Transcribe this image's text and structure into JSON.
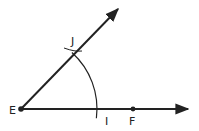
{
  "diagram": {
    "colors": {
      "stroke": "#222222",
      "background": "#ffffff"
    },
    "points": [
      {
        "id": "E",
        "label": "E",
        "x": 21,
        "y": 109,
        "dot": true,
        "label_x": 9,
        "label_y": 114
      },
      {
        "id": "J",
        "label": "J",
        "x": 74,
        "y": 55,
        "dot": false,
        "label_x": 71,
        "label_y": 45
      },
      {
        "id": "I",
        "label": "I",
        "x": 96,
        "y": 109,
        "dot": false,
        "label_x": 105,
        "label_y": 125
      },
      {
        "id": "F",
        "label": "F",
        "x": 133,
        "y": 109,
        "dot": true,
        "label_x": 129,
        "label_y": 125
      }
    ],
    "rays": [
      {
        "id": "ray-EF",
        "from": [
          21,
          109
        ],
        "to": [
          188,
          109
        ]
      },
      {
        "id": "ray-EJ",
        "from": [
          21,
          109
        ],
        "to": [
          118,
          9
        ]
      }
    ],
    "arcs": [
      {
        "id": "arc-centered-E",
        "center": [
          21,
          109
        ],
        "radius": 76,
        "start_deg": -48,
        "end_deg": 7
      }
    ],
    "tick_arcs": [
      {
        "id": "arc-mark-at-J",
        "d": "M64 48 Q75 52 82 51"
      }
    ]
  }
}
